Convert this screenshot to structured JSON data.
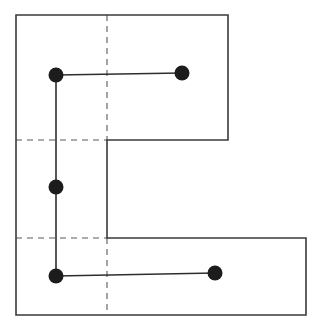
{
  "diagram": {
    "colors": {
      "background": "#ffffff",
      "outline": "#3a3a3a",
      "dashed": "#5a5a5a",
      "path": "#2e2e2e",
      "node": "#1c1c1c"
    },
    "outline_points": [
      [
        16,
        15
      ],
      [
        228,
        15
      ],
      [
        228,
        140
      ],
      [
        107,
        140
      ],
      [
        107,
        238
      ],
      [
        306,
        238
      ],
      [
        306,
        315
      ],
      [
        16,
        315
      ]
    ],
    "dashed_lines": [
      {
        "x1": 107,
        "y1": 15,
        "x2": 107,
        "y2": 140
      },
      {
        "x1": 16,
        "y1": 140,
        "x2": 107,
        "y2": 140
      },
      {
        "x1": 16,
        "y1": 238,
        "x2": 107,
        "y2": 238
      },
      {
        "x1": 107,
        "y1": 238,
        "x2": 107,
        "y2": 315
      }
    ],
    "path_segments": [
      {
        "x1": 56,
        "y1": 75,
        "x2": 182,
        "y2": 73
      },
      {
        "x1": 56,
        "y1": 75,
        "x2": 56,
        "y2": 276
      },
      {
        "x1": 56,
        "y1": 276,
        "x2": 215,
        "y2": 273
      }
    ],
    "nodes": [
      {
        "id": "n1",
        "cx": 56,
        "cy": 75,
        "r": 7.5
      },
      {
        "id": "n2",
        "cx": 182,
        "cy": 73,
        "r": 7.5
      },
      {
        "id": "n3",
        "cx": 56,
        "cy": 187,
        "r": 7.5
      },
      {
        "id": "n4",
        "cx": 56,
        "cy": 276,
        "r": 7.5
      },
      {
        "id": "n5",
        "cx": 215,
        "cy": 273,
        "r": 7.5
      }
    ]
  }
}
